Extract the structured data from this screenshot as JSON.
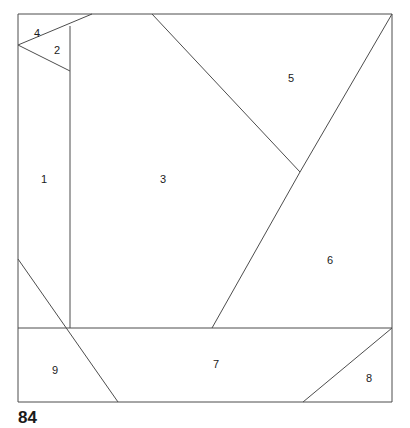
{
  "figure": {
    "caption": "84",
    "caption_position": {
      "x": 18,
      "y": 409
    },
    "frame": {
      "x": 18,
      "y": 14,
      "width": 374,
      "height": 388
    },
    "stroke_color": "#4d4d4d",
    "frame_stroke_color": "#4d4d4d",
    "background_color": "#ffffff",
    "label_color": "#1a1a1a",
    "stroke_width": 1
  },
  "regions": [
    {
      "id": "region-1",
      "label": "1",
      "label_x": 44,
      "label_y": 180,
      "points": "18,14 70,14 70,328 18,328"
    },
    {
      "id": "region-2",
      "label": "2",
      "label_x": 57,
      "label_y": 51,
      "points": "18,45 70,26 70,71"
    },
    {
      "id": "region-3",
      "label": "3",
      "label_x": 163,
      "label_y": 180,
      "points": "70,14 152,14 300,172 212,328 70,328"
    },
    {
      "id": "region-4",
      "label": "4",
      "label_x": 37,
      "label_y": 34,
      "points": "18,14 92,14 18,45"
    },
    {
      "id": "region-5",
      "label": "5",
      "label_x": 291,
      "label_y": 79,
      "points": "152,14 392,14 300,172"
    },
    {
      "id": "region-6",
      "label": "6",
      "label_x": 330,
      "label_y": 261,
      "points": "300,172 392,14 392,328 212,328"
    },
    {
      "id": "region-7",
      "label": "7",
      "label_x": 216,
      "label_y": 365,
      "points": "70,328 392,328 303,402 118,402"
    },
    {
      "id": "region-8",
      "label": "8",
      "label_x": 369,
      "label_y": 379,
      "points": "392,328 392,402 303,402"
    },
    {
      "id": "region-9",
      "label": "9",
      "label_x": 55,
      "label_y": 371,
      "points": "18,259 70,328 118,402 18,402"
    }
  ],
  "edges": [
    {
      "name": "frame-top",
      "x1": 18,
      "y1": 14,
      "x2": 392,
      "y2": 14
    },
    {
      "name": "frame-right",
      "x1": 392,
      "y1": 14,
      "x2": 392,
      "y2": 402
    },
    {
      "name": "frame-bottom",
      "x1": 392,
      "y1": 402,
      "x2": 18,
      "y2": 402
    },
    {
      "name": "frame-left",
      "x1": 18,
      "y1": 402,
      "x2": 18,
      "y2": 14
    },
    {
      "name": "edge-4-top-diagonal",
      "x1": 18,
      "y1": 45,
      "x2": 92,
      "y2": 14
    },
    {
      "name": "edge-2-lower",
      "x1": 18,
      "y1": 45,
      "x2": 70,
      "y2": 71
    },
    {
      "name": "edge-1-3-vertical",
      "x1": 70,
      "y1": 26,
      "x2": 70,
      "y2": 328
    },
    {
      "name": "edge-3-5-diagonal",
      "x1": 152,
      "y1": 14,
      "x2": 300,
      "y2": 172
    },
    {
      "name": "edge-5-6-diagonal",
      "x1": 300,
      "y1": 172,
      "x2": 392,
      "y2": 14
    },
    {
      "name": "edge-3-6-diagonal",
      "x1": 300,
      "y1": 172,
      "x2": 212,
      "y2": 328
    },
    {
      "name": "edge-7-horizontal",
      "x1": 18,
      "y1": 328,
      "x2": 392,
      "y2": 328
    },
    {
      "name": "edge-9-diagonal",
      "x1": 18,
      "y1": 259,
      "x2": 118,
      "y2": 402
    },
    {
      "name": "edge-8-diagonal",
      "x1": 303,
      "y1": 402,
      "x2": 392,
      "y2": 328
    }
  ]
}
